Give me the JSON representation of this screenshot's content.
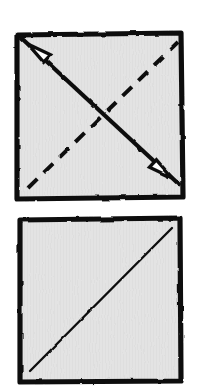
{
  "figure": {
    "title": "Origami fold diagram: diagonal valley fold on a square sheet",
    "background_color": "#ffffff",
    "paper_fill": "#e3e3e3",
    "ink_color": "#111111",
    "arrowhead_fill": "#ffffff",
    "panel_count": 2,
    "panels": [
      {
        "id": "panel-top",
        "label": "Step 1",
        "description": "Square sheet with a dashed diagonal fold line from bottom-left to top-right and a solid double-headed arrow from bottom-right to top-left indicating the fold direction.",
        "square": {
          "x": 15,
          "y": 33,
          "width": 169,
          "height": 167,
          "border_width": 5,
          "fill": "#e3e3e3",
          "stroke": "#111111"
        },
        "fold_line": {
          "style": "dashed",
          "dash_pattern": "13 9",
          "stroke_width": 4,
          "stroke": "#111111",
          "from": {
            "x": 28,
            "y": 188
          },
          "to": {
            "x": 178,
            "y": 42
          }
        },
        "motion_arrow": {
          "style": "solid",
          "double_headed": true,
          "stroke_width": 4,
          "stroke": "#111111",
          "arrowhead_fill": "#ffffff",
          "arrowhead_stroke": "#111111",
          "from": {
            "x": 170,
            "y": 176
          },
          "to": {
            "x": 30,
            "y": 46
          },
          "head_start_label": "arrow-head-bottom-right",
          "head_end_label": "arrow-head-top-left"
        }
      },
      {
        "id": "panel-bottom",
        "label": "Step 2",
        "description": "Square sheet showing the completed crease as a single thin solid diagonal line from bottom-left to top-right.",
        "square": {
          "x": 18,
          "y": 218,
          "width": 164,
          "height": 165,
          "border_width": 5,
          "fill": "#e3e3e3",
          "stroke": "#111111"
        },
        "crease_line": {
          "style": "solid",
          "stroke_width": 2.4,
          "stroke": "#111111",
          "from": {
            "x": 30,
            "y": 371
          },
          "to": {
            "x": 172,
            "y": 228
          }
        }
      }
    ]
  }
}
